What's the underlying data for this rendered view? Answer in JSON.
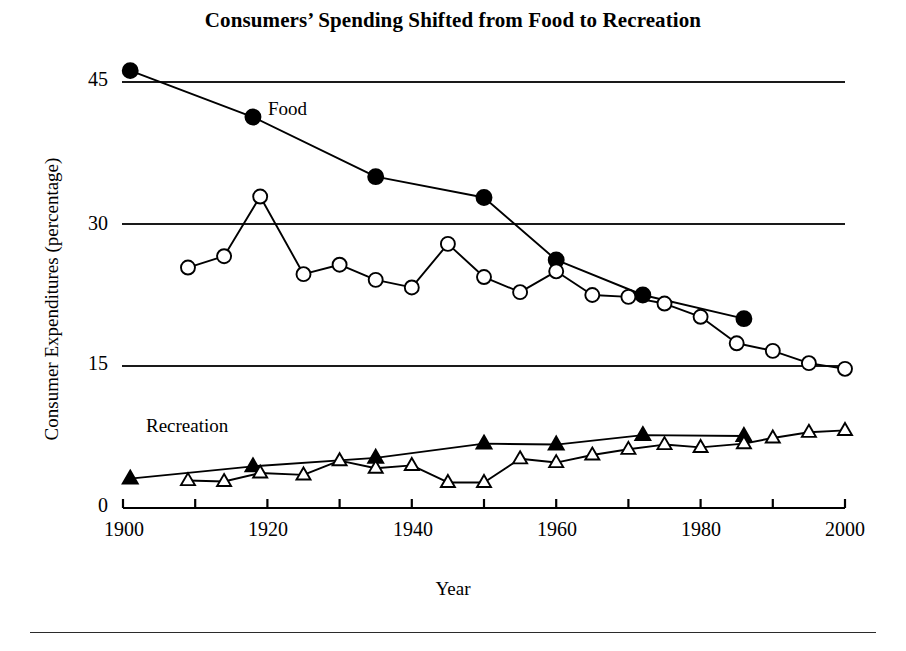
{
  "figure": {
    "title": "Consumers’ Spending Shifted from Food to Recreation",
    "xlabel": "Year",
    "ylabel": "Consumer Expenditures (percentage)",
    "series_labels": {
      "food": "Food",
      "recreation": "Recreation"
    },
    "y_ticks": [
      "0",
      "15",
      "30",
      "45"
    ],
    "x_ticks": [
      "1900",
      "1920",
      "1940",
      "1960",
      "1980",
      "2000"
    ],
    "colors": {
      "ink": "#000000",
      "background": "#ffffff",
      "gridline": "#1a1a1a"
    }
  },
  "chart_data": {
    "type": "line",
    "title": "Consumers’ Spending Shifted from Food to Recreation",
    "xlabel": "Year",
    "ylabel": "Consumer Expenditures (percentage)",
    "xlim": [
      1900,
      2000
    ],
    "ylim": [
      0,
      48
    ],
    "y_ticks": [
      0,
      15,
      30,
      45
    ],
    "x_ticks": [
      1900,
      1920,
      1940,
      1960,
      1980,
      2000
    ],
    "x_minor_tick_step": 10,
    "grid": "horizontal gridlines at 15, 30 and 45 only",
    "legend": "inline series labels: 'Food' near the filled-circle line, 'Recreation' near the triangle lines",
    "series": [
      {
        "name": "Food (benchmark, filled circles)",
        "marker": "filled-circle",
        "points": [
          {
            "x": 1901,
            "y": 46.2
          },
          {
            "x": 1918,
            "y": 41.3
          },
          {
            "x": 1935,
            "y": 35.0
          },
          {
            "x": 1950,
            "y": 32.8
          },
          {
            "x": 1960,
            "y": 26.2
          },
          {
            "x": 1972,
            "y": 22.5
          },
          {
            "x": 1986,
            "y": 20.0
          }
        ]
      },
      {
        "name": "Food (annual, open circles)",
        "marker": "open-circle",
        "points": [
          {
            "x": 1909,
            "y": 25.4
          },
          {
            "x": 1914,
            "y": 26.6
          },
          {
            "x": 1919,
            "y": 32.9
          },
          {
            "x": 1925,
            "y": 24.7
          },
          {
            "x": 1930,
            "y": 25.7
          },
          {
            "x": 1935,
            "y": 24.1
          },
          {
            "x": 1940,
            "y": 23.3
          },
          {
            "x": 1945,
            "y": 27.9
          },
          {
            "x": 1950,
            "y": 24.4
          },
          {
            "x": 1955,
            "y": 22.8
          },
          {
            "x": 1960,
            "y": 25.0
          },
          {
            "x": 1965,
            "y": 22.5
          },
          {
            "x": 1970,
            "y": 22.3
          },
          {
            "x": 1975,
            "y": 21.6
          },
          {
            "x": 1980,
            "y": 20.2
          },
          {
            "x": 1985,
            "y": 17.4
          },
          {
            "x": 1990,
            "y": 16.6
          },
          {
            "x": 1995,
            "y": 15.3
          },
          {
            "x": 2000,
            "y": 14.7
          }
        ]
      },
      {
        "name": "Recreation (benchmark, filled triangles)",
        "marker": "filled-triangle",
        "points": [
          {
            "x": 1901,
            "y": 3.1
          },
          {
            "x": 1918,
            "y": 4.4
          },
          {
            "x": 1935,
            "y": 5.3
          },
          {
            "x": 1950,
            "y": 6.8
          },
          {
            "x": 1960,
            "y": 6.7
          },
          {
            "x": 1972,
            "y": 7.7
          },
          {
            "x": 1986,
            "y": 7.6
          }
        ]
      },
      {
        "name": "Recreation (annual, open triangles)",
        "marker": "open-triangle",
        "points": [
          {
            "x": 1909,
            "y": 2.9
          },
          {
            "x": 1914,
            "y": 2.8
          },
          {
            "x": 1919,
            "y": 3.7
          },
          {
            "x": 1925,
            "y": 3.5
          },
          {
            "x": 1930,
            "y": 5.0
          },
          {
            "x": 1935,
            "y": 4.2
          },
          {
            "x": 1940,
            "y": 4.5
          },
          {
            "x": 1945,
            "y": 2.7
          },
          {
            "x": 1950,
            "y": 2.7
          },
          {
            "x": 1955,
            "y": 5.2
          },
          {
            "x": 1960,
            "y": 4.8
          },
          {
            "x": 1965,
            "y": 5.6
          },
          {
            "x": 1970,
            "y": 6.2
          },
          {
            "x": 1975,
            "y": 6.7
          },
          {
            "x": 1980,
            "y": 6.4
          },
          {
            "x": 1986,
            "y": 6.8
          },
          {
            "x": 1990,
            "y": 7.4
          },
          {
            "x": 1995,
            "y": 8.0
          },
          {
            "x": 2000,
            "y": 8.2
          }
        ]
      }
    ]
  }
}
